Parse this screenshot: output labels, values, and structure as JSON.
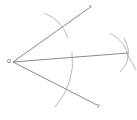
{
  "diagram": {
    "type": "angle-bisector-construction",
    "labels": {
      "vertex": "O",
      "ray_upper": "x",
      "ray_lower": "y"
    },
    "colors": {
      "line": "#6a6a6a",
      "arc": "#9a9a9a",
      "background": "#ffffff"
    },
    "points": {
      "O": [
        13,
        62
      ],
      "X": [
        89,
        8
      ],
      "Y": [
        97,
        105
      ],
      "P": [
        128,
        53
      ]
    }
  }
}
